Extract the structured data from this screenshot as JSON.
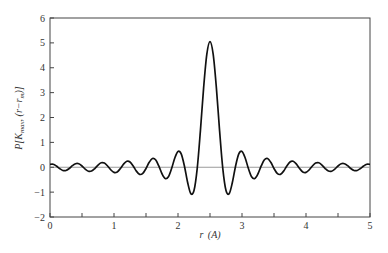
{
  "chart_data": {
    "type": "line",
    "title": "",
    "xlabel": "r (A)",
    "ylabel": "P[K_max, (r−r_m)]",
    "xlim": [
      0,
      5
    ],
    "ylim": [
      -2,
      6
    ],
    "x_ticks": [
      0,
      1,
      2,
      3,
      4,
      5
    ],
    "x_minor_ticks": [
      0.5,
      1.5,
      2.5,
      3.5,
      4.5
    ],
    "y_ticks": [
      -2,
      -1,
      0,
      1,
      2,
      3,
      4,
      5,
      6
    ],
    "grid": false,
    "legend": null,
    "reference_line": {
      "y": 0,
      "color": "#9a9a9a"
    },
    "series": [
      {
        "name": "P",
        "color": "#111111",
        "x": [
          0.0,
          0.05,
          0.1,
          0.15,
          0.2,
          0.25,
          0.3,
          0.35,
          0.4,
          0.45,
          0.5,
          0.55,
          0.6,
          0.65,
          0.7,
          0.75,
          0.8,
          0.85,
          0.9,
          0.95,
          1.0,
          1.05,
          1.1,
          1.15,
          1.2,
          1.25,
          1.3,
          1.35,
          1.4,
          1.45,
          1.5,
          1.55,
          1.6,
          1.65,
          1.7,
          1.75,
          1.8,
          1.85,
          1.9,
          1.95,
          2.0,
          2.05,
          2.1,
          2.15,
          2.2,
          2.25,
          2.3,
          2.35,
          2.4,
          2.45,
          2.5,
          2.55,
          2.6,
          2.65,
          2.7,
          2.75,
          2.8,
          2.85,
          2.9,
          2.95,
          3.0,
          3.05,
          3.1,
          3.15,
          3.2,
          3.25,
          3.3,
          3.35,
          3.4,
          3.45,
          3.5,
          3.55,
          3.6,
          3.65,
          3.7,
          3.75,
          3.8,
          3.85,
          3.9,
          3.95,
          4.0,
          4.05,
          4.1,
          4.15,
          4.2,
          4.25,
          4.3,
          4.35,
          4.4,
          4.45,
          4.5,
          4.55,
          4.6,
          4.65,
          4.7,
          4.75,
          4.8,
          4.85,
          4.9,
          4.95,
          5.0
        ],
        "y": [
          0.117,
          0.12,
          0.05,
          -0.053,
          -0.129,
          -0.129,
          -0.051,
          0.063,
          0.143,
          0.14,
          0.051,
          -0.074,
          -0.159,
          -0.152,
          -0.051,
          0.087,
          0.18,
          0.168,
          0.051,
          -0.105,
          -0.206,
          -0.187,
          -0.051,
          0.127,
          0.239,
          0.213,
          0.051,
          -0.156,
          -0.285,
          -0.248,
          -0.051,
          0.198,
          0.35,
          0.299,
          0.052,
          -0.261,
          -0.452,
          -0.381,
          -0.052,
          0.371,
          0.635,
          0.535,
          0.052,
          -0.605,
          -1.06,
          -0.936,
          -0.052,
          1.463,
          3.183,
          4.538,
          5.05,
          4.538,
          3.183,
          1.463,
          -0.052,
          -0.936,
          -1.06,
          -0.605,
          0.052,
          0.535,
          0.635,
          0.371,
          -0.052,
          -0.381,
          -0.452,
          -0.261,
          0.052,
          0.299,
          0.35,
          0.198,
          -0.051,
          -0.248,
          -0.285,
          -0.156,
          0.051,
          0.213,
          0.239,
          0.127,
          -0.051,
          -0.187,
          -0.206,
          -0.105,
          0.051,
          0.168,
          0.18,
          0.087,
          -0.051,
          -0.152,
          -0.159,
          -0.074,
          0.051,
          0.14,
          0.143,
          0.063,
          -0.051,
          -0.129,
          -0.129,
          -0.053,
          0.05,
          0.12,
          0.117
        ]
      }
    ]
  },
  "layout": {
    "plot": {
      "left": 50,
      "top": 18,
      "right": 370,
      "bottom": 217
    }
  },
  "labels": {
    "xlabel_main": "r",
    "xlabel_unit": "(A)"
  }
}
